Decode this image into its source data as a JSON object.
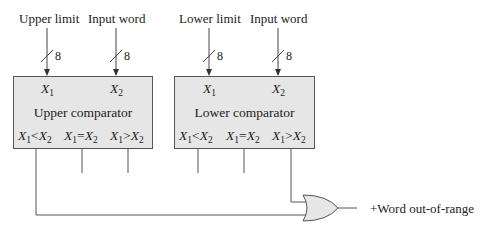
{
  "diagram": {
    "inputs": [
      {
        "label": "Upper limit",
        "bus_width": "8",
        "port": "X",
        "port_sub": "1"
      },
      {
        "label": "Input word",
        "bus_width": "8",
        "port": "X",
        "port_sub": "2"
      },
      {
        "label": "Lower limit",
        "bus_width": "8",
        "port": "X",
        "port_sub": "1"
      },
      {
        "label": "Input word",
        "bus_width": "8",
        "port": "X",
        "port_sub": "2"
      }
    ],
    "blocks": [
      {
        "title": "Upper comparator",
        "outputs": [
          {
            "a": "X",
            "a_sub": "1",
            "op": "<",
            "b": "X",
            "b_sub": "2"
          },
          {
            "a": "X",
            "a_sub": "1",
            "op": "=",
            "b": "X",
            "b_sub": "2"
          },
          {
            "a": "X",
            "a_sub": "1",
            "op": ">",
            "b": "X",
            "b_sub": "2"
          }
        ]
      },
      {
        "title": "Lower comparator",
        "outputs": [
          {
            "a": "X",
            "a_sub": "1",
            "op": "<",
            "b": "X",
            "b_sub": "2"
          },
          {
            "a": "X",
            "a_sub": "1",
            "op": "=",
            "b": "X",
            "b_sub": "2"
          },
          {
            "a": "X",
            "a_sub": "1",
            "op": ">",
            "b": "X",
            "b_sub": "2"
          }
        ]
      }
    ],
    "gate": {
      "type": "OR",
      "output_label": "+Word out-of-range"
    },
    "colors": {
      "line": "#555555",
      "fill": "#e6e6e6",
      "text": "#222222"
    }
  }
}
